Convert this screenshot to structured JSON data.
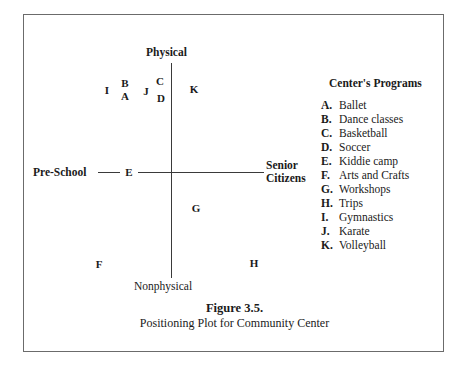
{
  "figure": {
    "caption_title": "Figure 3.5.",
    "caption_subtitle": "Positioning Plot for Community Center"
  },
  "axes": {
    "top_label": "Physical",
    "bottom_label": "Nonphysical",
    "left_label": "Pre-School",
    "right_label": "Senior Citizens"
  },
  "legend": {
    "title": "Center's Programs",
    "items": [
      {
        "key": "A.",
        "label": "Ballet"
      },
      {
        "key": "B.",
        "label": "Dance classes"
      },
      {
        "key": "C.",
        "label": "Basketball"
      },
      {
        "key": "D.",
        "label": "Soccer"
      },
      {
        "key": "E.",
        "label": "Kiddie camp"
      },
      {
        "key": "F.",
        "label": "Arts and Crafts"
      },
      {
        "key": "G.",
        "label": "Workshops"
      },
      {
        "key": "H.",
        "label": "Trips"
      },
      {
        "key": "I.",
        "label": "Gymnastics"
      },
      {
        "key": "J.",
        "label": "Karate"
      },
      {
        "key": "K.",
        "label": "Volleyball"
      }
    ]
  },
  "chart_data": {
    "type": "scatter",
    "title": "Positioning Plot for Community Center",
    "xlabel": "Pre-School ↔ Senior Citizens",
    "ylabel": "Nonphysical ↔ Physical",
    "x_axis_left": "Pre-School",
    "x_axis_right": "Senior Citizens",
    "y_axis_top": "Physical",
    "y_axis_bottom": "Nonphysical",
    "grid": false,
    "legend_position": "right",
    "note": "Perceptual map. Axes cross at the origin; x runs from Pre-School (left) to Senior Citizens (right), y runs from Nonphysical (bottom) to Physical (top). Positions are normalized to -1..1 about the origin.",
    "points": [
      {
        "key": "A",
        "label": "Ballet",
        "x": -0.38,
        "y": 0.59,
        "px": 101,
        "py": 81
      },
      {
        "key": "B",
        "label": "Dance classes",
        "x": -0.38,
        "y": 0.72,
        "px": 101,
        "py": 68
      },
      {
        "key": "C",
        "label": "Basketball",
        "x": -0.09,
        "y": 0.85,
        "px": 136,
        "py": 66
      },
      {
        "key": "D",
        "label": "Soccer",
        "x": -0.08,
        "y": 0.67,
        "px": 137,
        "py": 83
      },
      {
        "key": "E",
        "label": "Kiddie camp",
        "x": -0.7,
        "y": 0.0,
        "px": 105,
        "py": 157
      },
      {
        "key": "F",
        "label": "Arts and Crafts",
        "x": -0.55,
        "y": -0.88,
        "px": 75,
        "py": 249
      },
      {
        "key": "G",
        "label": "Workshops",
        "x": 0.22,
        "y": -0.42,
        "px": 172,
        "py": 193
      },
      {
        "key": "H",
        "label": "Trips",
        "x": 0.72,
        "y": -0.87,
        "px": 230,
        "py": 248
      },
      {
        "key": "I",
        "label": "Gymnastics",
        "x": -0.55,
        "y": 0.64,
        "px": 83,
        "py": 75
      },
      {
        "key": "J",
        "label": "Karate",
        "x": -0.24,
        "y": 0.63,
        "px": 122,
        "py": 76
      },
      {
        "key": "K",
        "label": "Volleyball",
        "x": 0.21,
        "y": 0.7,
        "px": 170,
        "py": 74
      }
    ]
  }
}
